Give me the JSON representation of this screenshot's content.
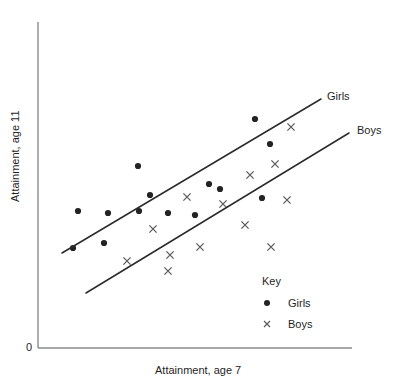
{
  "chart_data": {
    "type": "scatter",
    "title": "",
    "xlabel": "Attainment, age 7",
    "ylabel": "Attainment, age 11",
    "origin_tick": "0",
    "grid": false,
    "legend_position": "inside-bottom-right",
    "legend_title": "Key",
    "axis_ranges_labelled": false,
    "series": [
      {
        "name": "Girls",
        "marker": "filled-circle",
        "color": "#232323",
        "line_label": "Girls",
        "points": [
          {
            "x": 78,
            "y": 211
          },
          {
            "x": 73,
            "y": 248
          },
          {
            "x": 108,
            "y": 213
          },
          {
            "x": 139,
            "y": 211
          },
          {
            "x": 104,
            "y": 243
          },
          {
            "x": 138,
            "y": 166
          },
          {
            "x": 150,
            "y": 195
          },
          {
            "x": 168,
            "y": 213
          },
          {
            "x": 195,
            "y": 215
          },
          {
            "x": 209,
            "y": 184
          },
          {
            "x": 220,
            "y": 189
          },
          {
            "x": 262,
            "y": 198
          },
          {
            "x": 255,
            "y": 119
          },
          {
            "x": 270,
            "y": 144
          }
        ],
        "trend_line": {
          "x1": 62,
          "y1": 253,
          "x2": 321,
          "y2": 99
        }
      },
      {
        "name": "Boys",
        "marker": "x-cross",
        "color": "#5a5a5a",
        "line_label": "Boys",
        "points": [
          {
            "x": 127,
            "y": 261
          },
          {
            "x": 153,
            "y": 229
          },
          {
            "x": 170,
            "y": 255
          },
          {
            "x": 187,
            "y": 197
          },
          {
            "x": 168,
            "y": 271
          },
          {
            "x": 200,
            "y": 247
          },
          {
            "x": 223,
            "y": 204
          },
          {
            "x": 245,
            "y": 225
          },
          {
            "x": 250,
            "y": 175
          },
          {
            "x": 271,
            "y": 247
          },
          {
            "x": 275,
            "y": 164
          },
          {
            "x": 287,
            "y": 200
          },
          {
            "x": 291,
            "y": 127
          }
        ],
        "trend_line": {
          "x1": 86,
          "y1": 293,
          "x2": 349,
          "y2": 133
        }
      }
    ],
    "axes": {
      "y_axis": {
        "x": 38,
        "y_top": 22,
        "y_bottom": 348
      },
      "x_axis": {
        "y": 348,
        "x_left": 38,
        "x_right": 352
      }
    }
  },
  "legend": {
    "title": "Key",
    "items": [
      {
        "label": "Girls",
        "marker": "filled-circle"
      },
      {
        "label": "Boys",
        "marker": "x-cross"
      }
    ]
  },
  "labels": {
    "y_axis": "Attainment, age 11",
    "x_axis": "Attainment, age 7",
    "origin": "0",
    "girls_line": "Girls",
    "boys_line": "Boys"
  }
}
